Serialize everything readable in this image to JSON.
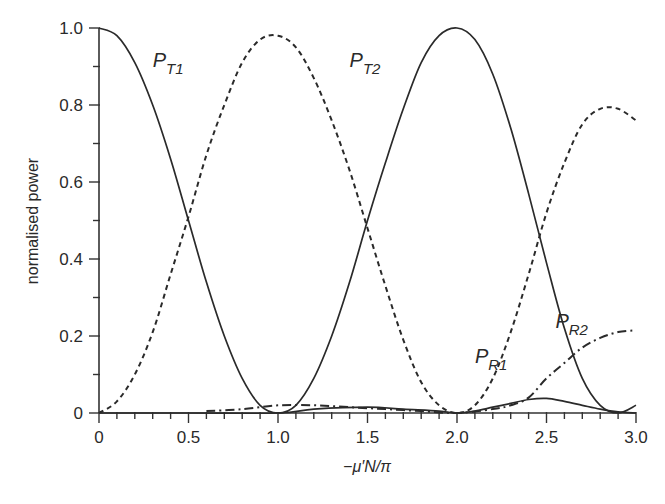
{
  "chart_data": {
    "type": "line",
    "title": "",
    "xlabel": "−μ′N/π",
    "ylabel": "normalised power",
    "xlim": [
      0,
      3.0
    ],
    "ylim": [
      0,
      1.0
    ],
    "x_ticks": [
      "0",
      "0.5",
      "1.0",
      "1.5",
      "2.0",
      "2.5",
      "3.0"
    ],
    "y_ticks": [
      "0",
      "0.2",
      "0.4",
      "0.6",
      "0.8",
      "1.0"
    ],
    "x_minor_step": 0.1,
    "y_minor_step": 0.1,
    "grid": false,
    "legend": "inline labels",
    "series": [
      {
        "name": "P_T1",
        "label_main": "P",
        "label_sub": "T1",
        "style": "solid",
        "label_pos": [
          0.3,
          0.9
        ],
        "x": [
          0,
          0.1,
          0.2,
          0.3,
          0.4,
          0.5,
          0.6,
          0.7,
          0.8,
          0.9,
          1.0,
          1.1,
          1.2,
          1.3,
          1.4,
          1.5,
          1.6,
          1.7,
          1.8,
          1.9,
          2.0,
          2.1,
          2.2,
          2.3,
          2.4,
          2.5,
          2.6,
          2.7,
          2.8,
          2.9,
          3.0
        ],
        "y": [
          1.0,
          0.98,
          0.91,
          0.8,
          0.66,
          0.5,
          0.34,
          0.2,
          0.09,
          0.02,
          0.0,
          0.02,
          0.09,
          0.2,
          0.34,
          0.5,
          0.65,
          0.79,
          0.91,
          0.98,
          1.0,
          0.97,
          0.88,
          0.74,
          0.57,
          0.39,
          0.22,
          0.09,
          0.02,
          0.0,
          0.02
        ]
      },
      {
        "name": "P_T2",
        "label_main": "P",
        "label_sub": "T2",
        "style": "dashed",
        "label_pos": [
          1.4,
          0.9
        ],
        "x": [
          0,
          0.1,
          0.2,
          0.3,
          0.4,
          0.5,
          0.6,
          0.7,
          0.8,
          0.9,
          1.0,
          1.1,
          1.2,
          1.3,
          1.4,
          1.5,
          1.6,
          1.7,
          1.8,
          1.9,
          2.0,
          2.1,
          2.2,
          2.3,
          2.4,
          2.5,
          2.6,
          2.7,
          2.8,
          2.9,
          3.0
        ],
        "y": [
          0.0,
          0.03,
          0.1,
          0.21,
          0.36,
          0.51,
          0.67,
          0.8,
          0.91,
          0.97,
          0.98,
          0.95,
          0.87,
          0.76,
          0.63,
          0.48,
          0.33,
          0.19,
          0.08,
          0.02,
          0.0,
          0.02,
          0.09,
          0.21,
          0.36,
          0.52,
          0.65,
          0.75,
          0.79,
          0.79,
          0.76
        ]
      },
      {
        "name": "P_R1",
        "label_main": "P",
        "label_sub": "R1",
        "style": "solid",
        "label_pos": [
          2.1,
          0.13
        ],
        "x": [
          0,
          0.5,
          1.0,
          1.2,
          1.5,
          1.7,
          1.9,
          2.0,
          2.1,
          2.2,
          2.3,
          2.4,
          2.5,
          2.6,
          2.7,
          2.8,
          2.9,
          3.0
        ],
        "y": [
          0.0,
          0.0,
          0.0,
          0.01,
          0.015,
          0.01,
          0.005,
          0.0,
          0.005,
          0.015,
          0.025,
          0.035,
          0.038,
          0.03,
          0.02,
          0.01,
          0.003,
          0.0
        ]
      },
      {
        "name": "P_R2",
        "label_main": "P",
        "label_sub": "R2",
        "style": "dash-dot",
        "label_pos": [
          2.55,
          0.22
        ],
        "x": [
          0.6,
          0.8,
          1.0,
          1.2,
          1.4,
          1.6,
          1.8,
          2.0,
          2.2,
          2.3,
          2.4,
          2.5,
          2.6,
          2.7,
          2.8,
          2.9,
          3.0
        ],
        "y": [
          0.005,
          0.01,
          0.02,
          0.02,
          0.015,
          0.01,
          0.005,
          0.0,
          0.01,
          0.02,
          0.04,
          0.09,
          0.13,
          0.17,
          0.195,
          0.21,
          0.215
        ]
      }
    ]
  }
}
